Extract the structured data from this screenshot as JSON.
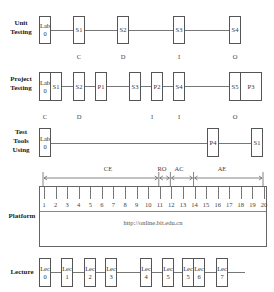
{
  "rows": {
    "unit_testing": {
      "label_line1": "Unit",
      "label_line2": "Testing",
      "boxes": [
        {
          "line1": "Lab",
          "line2": "0"
        },
        {
          "line1": "S1",
          "line2": ""
        },
        {
          "line1": "S2",
          "line2": ""
        },
        {
          "line1": "S3",
          "line2": ""
        },
        {
          "line1": "S4",
          "line2": ""
        }
      ],
      "phases": [
        "C",
        "D",
        "I",
        "O"
      ]
    },
    "project_testing": {
      "label_line1": "Project",
      "label_line2": "Testing",
      "boxes": [
        {
          "line1": "Lab",
          "line2": "0"
        },
        {
          "line1": "S1",
          "line2": ""
        },
        {
          "line1": "S2",
          "line2": ""
        },
        {
          "line1": "P1",
          "line2": ""
        },
        {
          "line1": "S3",
          "line2": ""
        },
        {
          "line1": "P2",
          "line2": ""
        },
        {
          "line1": "S4",
          "line2": ""
        },
        {
          "line1": "S5",
          "line2": ""
        },
        {
          "line1": "P3",
          "line2": ""
        }
      ],
      "phases": [
        "C",
        "D",
        "I",
        "I",
        "O"
      ]
    },
    "test_tools": {
      "label_line1": "Test",
      "label_line2": "Tools",
      "label_line3": "Using",
      "boxes": [
        {
          "line1": "Lab",
          "line2": "0"
        },
        {
          "line1": "P4",
          "line2": ""
        },
        {
          "line1": "S1",
          "line2": ""
        }
      ]
    },
    "platform": {
      "label": "Platform",
      "url": "http://online.bit.edu.cn",
      "weeks": [
        "1",
        "2",
        "3",
        "4",
        "5",
        "6",
        "7",
        "8",
        "9",
        "10",
        "11",
        "12",
        "13",
        "14",
        "15",
        "16",
        "17",
        "18",
        "19",
        "20"
      ],
      "spans": [
        {
          "label": "CE",
          "from_week": 1,
          "to_week": 11
        },
        {
          "label": "RO",
          "from_week": 11,
          "to_week": 12
        },
        {
          "label": "AC",
          "from_week": 12,
          "to_week": 14
        },
        {
          "label": "AE",
          "from_week": 14,
          "to_week": 20
        }
      ]
    },
    "lecture": {
      "label": "Lecture",
      "boxes": [
        {
          "line1": "Lec",
          "line2": "0"
        },
        {
          "line1": "Lec",
          "line2": "1"
        },
        {
          "line1": "Lec",
          "line2": "2"
        },
        {
          "line1": "Lec",
          "line2": "3"
        },
        {
          "line1": "Lec",
          "line2": "4"
        },
        {
          "line1": "Lec",
          "line2": "5"
        },
        {
          "line1": "Lec",
          "line2": "5"
        },
        {
          "line1": "Lec",
          "line2": "6"
        },
        {
          "line1": "Lec",
          "line2": "7"
        }
      ]
    }
  }
}
